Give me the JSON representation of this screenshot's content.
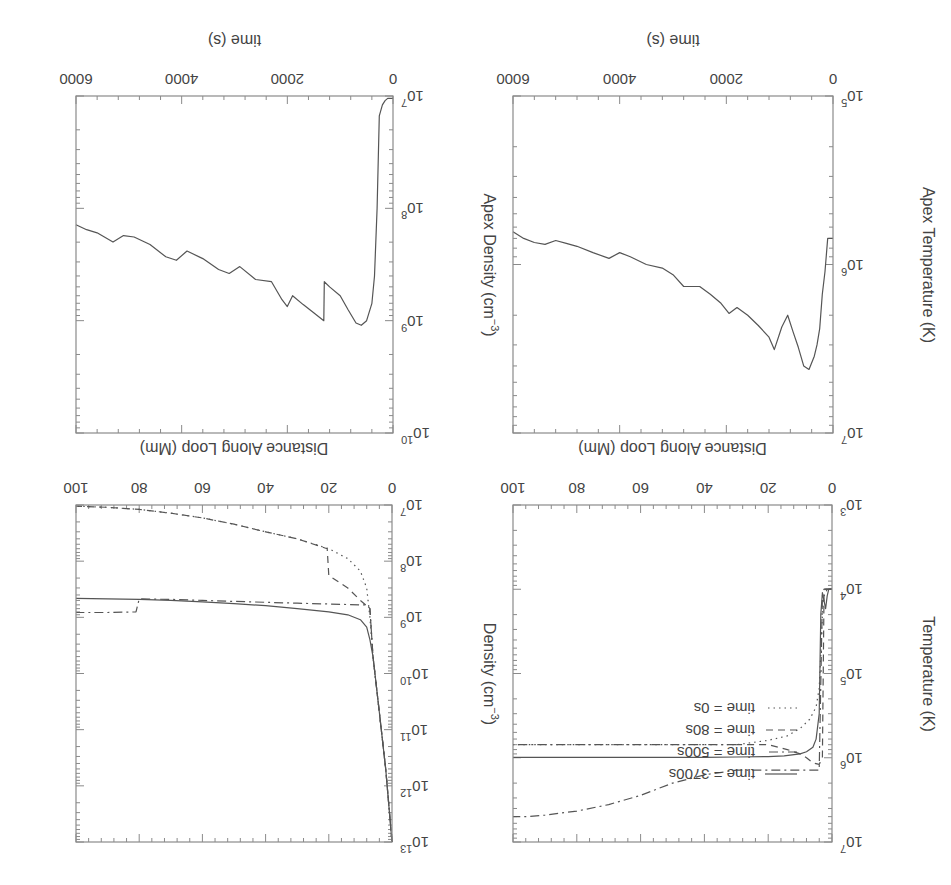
{
  "figure": {
    "rotation_deg": 180,
    "line_color": "#555555",
    "frame_color": "#8a8a8a",
    "background": "#ffffff"
  },
  "chart_data": [
    {
      "id": "temperature_profile",
      "type": "line",
      "title": "",
      "xlabel": "Distance Along Loop (Mm)",
      "ylabel": "Temperature (K)",
      "xlim": [
        0,
        100
      ],
      "ylim": [
        1000,
        10000000
      ],
      "yscale": "log",
      "xticks": [
        0,
        20,
        40,
        60,
        80,
        100
      ],
      "xtick_labels": [
        "0",
        "20",
        "40",
        "60",
        "80",
        "100"
      ],
      "yticks": [
        1000,
        10000,
        100000,
        1000000,
        10000000
      ],
      "ytick_labels": [
        "10^3",
        "10^4",
        "10^5",
        "10^6",
        "10^7"
      ],
      "grid": false,
      "legend": {
        "position": "upper left",
        "entries": [
          {
            "label": "time = 3700s",
            "style": "solid"
          },
          {
            "label": "time = 500s",
            "style": "dashdot"
          },
          {
            "label": "time = 80s",
            "style": "dashed"
          },
          {
            "label": "time = 0s",
            "style": "dotted"
          }
        ]
      },
      "series": [
        {
          "name": "time = 0s",
          "style": "dotted",
          "x": [
            0,
            1.5,
            2.5,
            3,
            3.5,
            4,
            5,
            7,
            10,
            14,
            20,
            30,
            40,
            50,
            60,
            70,
            80,
            90,
            100
          ],
          "y": [
            10000,
            10000,
            12000,
            20000,
            60000,
            150000,
            250000,
            350000,
            450000,
            550000,
            620000,
            700000,
            700000,
            700000,
            700000,
            700000,
            700000,
            700000,
            700000
          ]
        },
        {
          "name": "time = 80s",
          "style": "dashed",
          "x": [
            0,
            2,
            2.5,
            3,
            4,
            6,
            8,
            10,
            14,
            20,
            30
          ],
          "y": [
            10000,
            10000,
            12000,
            1000000,
            1200000,
            1150000,
            1000000,
            900000,
            800000,
            700000,
            700000
          ]
        },
        {
          "name": "time = 500s",
          "style": "dashdot",
          "x": [
            0,
            2.5,
            3,
            4,
            6,
            10,
            20,
            30,
            40,
            50,
            60,
            70,
            80,
            90,
            95,
            100
          ],
          "y": [
            10000,
            10000,
            12000,
            1400000,
            1400000,
            1400000,
            1400000,
            1400000,
            1600000,
            2000000,
            2800000,
            3600000,
            4300000,
            4800000,
            5000000,
            5000000
          ]
        },
        {
          "name": "time = 500s (low branch)",
          "style": "dashdot",
          "x": [
            30,
            40,
            50,
            60,
            70,
            80,
            90,
            100
          ],
          "y": [
            700000,
            700000,
            700000,
            700000,
            700000,
            700000,
            700000,
            700000
          ]
        },
        {
          "name": "time = 3700s",
          "style": "solid",
          "x": [
            0,
            0.5,
            1,
            1.5,
            2,
            3,
            3.5,
            4,
            5,
            6,
            8,
            10,
            15,
            20,
            30,
            40,
            50,
            60,
            70,
            80,
            90,
            100
          ],
          "y": [
            10000,
            10000,
            10000,
            12000,
            17000,
            11000,
            20000,
            300000,
            600000,
            750000,
            850000,
            900000,
            950000,
            970000,
            980000,
            990000,
            990000,
            990000,
            990000,
            990000,
            990000,
            990000
          ]
        }
      ]
    },
    {
      "id": "density_profile",
      "type": "line",
      "title": "",
      "xlabel": "Distance Along Loop (Mm)",
      "ylabel": "Density (cm^-3)",
      "xlim": [
        0,
        100
      ],
      "ylim": [
        10000000,
        10000000000000
      ],
      "yscale": "log",
      "xticks": [
        0,
        20,
        40,
        60,
        80,
        100
      ],
      "xtick_labels": [
        "0",
        "20",
        "40",
        "60",
        "80",
        "100"
      ],
      "yticks": [
        10000000,
        100000000,
        1000000000,
        10000000000,
        100000000000,
        1000000000000,
        10000000000000
      ],
      "ytick_labels": [
        "10^7",
        "10^8",
        "10^9",
        "10^10",
        "10^11",
        "10^12",
        "10^13"
      ],
      "grid": false,
      "series": [
        {
          "name": "time = 0s",
          "style": "dotted",
          "x": [
            0,
            2,
            4,
            6,
            7,
            8,
            10,
            14,
            20,
            30,
            40,
            50,
            60,
            70,
            80,
            90,
            100
          ],
          "y": [
            10000000000000,
            500000000000,
            50000000000,
            5000000000,
            1000000000,
            300000000,
            150000000,
            90000000,
            60000000,
            40000000,
            30000000,
            22000000,
            17000000,
            14000000,
            12000000,
            11000000,
            10500000
          ]
        },
        {
          "name": "time = 80s",
          "style": "dashed",
          "x": [
            0,
            2,
            4,
            6,
            7,
            10,
            14,
            20,
            20.5,
            30,
            40,
            50,
            60,
            70,
            80,
            90,
            100
          ],
          "y": [
            10000000000000,
            500000000000,
            50000000000,
            5000000000,
            700000000,
            500000000,
            300000000,
            180000000,
            60000000,
            40000000,
            30000000,
            22000000,
            17000000,
            14000000,
            12000000,
            11000000,
            10500000
          ]
        },
        {
          "name": "time = 500s",
          "style": "dashdot",
          "x": [
            0,
            2,
            4,
            6,
            7,
            8,
            10,
            20,
            30,
            40,
            50,
            60,
            70,
            80,
            81,
            90,
            100
          ],
          "y": [
            10000000000000,
            500000000000,
            50000000000,
            5000000000,
            700000000,
            600000000,
            600000000,
            580000000,
            560000000,
            540000000,
            520000000,
            500000000,
            480000000,
            470000000,
            800000000,
            820000000,
            820000000
          ]
        },
        {
          "name": "time = 3700s",
          "style": "solid",
          "x": [
            0,
            2,
            4,
            6,
            7,
            8,
            10,
            14,
            20,
            30,
            40,
            50,
            60,
            70,
            80,
            90,
            100
          ],
          "y": [
            10000000000000,
            500000000000,
            50000000000,
            5000000000,
            2500000000,
            1500000000,
            1100000000,
            900000000,
            800000000,
            700000000,
            620000000,
            570000000,
            530000000,
            500000000,
            480000000,
            470000000,
            460000000
          ]
        }
      ]
    },
    {
      "id": "apex_temperature",
      "type": "line",
      "title": "",
      "xlabel": "time (s)",
      "ylabel": "Apex Temperature (K)",
      "xlim": [
        0,
        6000
      ],
      "ylim": [
        100000,
        10000000
      ],
      "yscale": "log",
      "xticks": [
        0,
        2000,
        4000,
        6000
      ],
      "xtick_labels": [
        "0",
        "2000",
        "4000",
        "6000"
      ],
      "yticks": [
        100000,
        1000000,
        10000000
      ],
      "ytick_labels": [
        "10^5",
        "10^6",
        "10^7"
      ],
      "grid": false,
      "series": [
        {
          "name": "apex T",
          "style": "solid",
          "x": [
            0,
            100,
            150,
            200,
            250,
            300,
            350,
            450,
            550,
            650,
            750,
            850,
            960,
            1100,
            1200,
            1400,
            1600,
            1800,
            1950,
            2100,
            2300,
            2500,
            2800,
            3000,
            3200,
            3500,
            3800,
            4000,
            4200,
            4500,
            4800,
            5000,
            5200,
            5400,
            5600,
            5800,
            6000
          ],
          "y": [
            700000,
            700000,
            1100000,
            1500000,
            2400000,
            3000000,
            3500000,
            4200000,
            4000000,
            3100000,
            2500000,
            2000000,
            2350000,
            3200000,
            2700000,
            2300000,
            2000000,
            1800000,
            1950000,
            1700000,
            1500000,
            1350000,
            1350000,
            1150000,
            1050000,
            1000000,
            900000,
            850000,
            920000,
            850000,
            780000,
            750000,
            720000,
            760000,
            740000,
            700000,
            640000
          ]
        }
      ]
    },
    {
      "id": "apex_density",
      "type": "line",
      "title": "",
      "xlabel": "time (s)",
      "ylabel": "Apex Density (cm^-3)",
      "xlim": [
        0,
        6000
      ],
      "ylim": [
        10000000,
        10000000000
      ],
      "yscale": "log",
      "xticks": [
        0,
        2000,
        4000,
        6000
      ],
      "xtick_labels": [
        "0",
        "2000",
        "4000",
        "6000"
      ],
      "yticks": [
        10000000,
        100000000,
        1000000000,
        10000000000
      ],
      "ytick_labels": [
        "10^7",
        "10^8",
        "10^9",
        "10^10"
      ],
      "grid": false,
      "series": [
        {
          "name": "apex n",
          "style": "solid",
          "x": [
            0,
            100,
            150,
            200,
            260,
            300,
            350,
            400,
            500,
            600,
            700,
            850,
            1000,
            1200,
            1300,
            1310,
            1500,
            1700,
            1900,
            2000,
            2100,
            2300,
            2600,
            2900,
            3100,
            3300,
            3600,
            3900,
            4100,
            4300,
            4600,
            4900,
            5100,
            5300,
            5600,
            5800,
            6000
          ],
          "y": [
            10500000,
            10500000,
            11000000,
            12000000,
            15000000,
            100000000,
            400000000,
            700000000,
            1000000000,
            1100000000,
            1050000000,
            800000000,
            600000000,
            500000000,
            450000000,
            1000000000,
            850000000,
            720000000,
            600000000,
            750000000,
            650000000,
            450000000,
            430000000,
            330000000,
            380000000,
            350000000,
            280000000,
            240000000,
            290000000,
            270000000,
            210000000,
            180000000,
            175000000,
            200000000,
            165000000,
            155000000,
            140000000
          ]
        }
      ]
    }
  ]
}
